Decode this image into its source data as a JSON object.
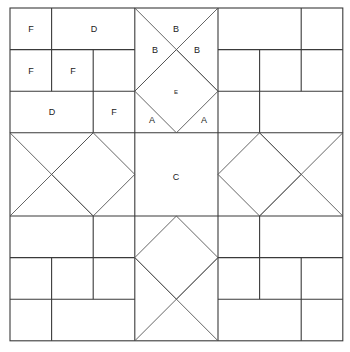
{
  "diagram": {
    "type": "quilt-block-piecing-diagram",
    "grid": "8x8",
    "labels": [
      {
        "id": "tl-f1",
        "text": "F",
        "x": 31,
        "y": 29
      },
      {
        "id": "tl-d1",
        "text": "D",
        "x": 94,
        "y": 29
      },
      {
        "id": "tl-f2",
        "text": "F",
        "x": 31,
        "y": 71
      },
      {
        "id": "tl-f3",
        "text": "F",
        "x": 73,
        "y": 71
      },
      {
        "id": "tl-d2",
        "text": "D",
        "x": 52,
        "y": 112
      },
      {
        "id": "tl-f4",
        "text": "F",
        "x": 114,
        "y": 112
      },
      {
        "id": "tc-b-top",
        "text": "B",
        "x": 176,
        "y": 29
      },
      {
        "id": "tc-b-left",
        "text": "B",
        "x": 155,
        "y": 50
      },
      {
        "id": "tc-b-right",
        "text": "B",
        "x": 197,
        "y": 50
      },
      {
        "id": "tc-e",
        "text": "E",
        "x": 176,
        "y": 92,
        "small": true
      },
      {
        "id": "tc-a-left",
        "text": "A",
        "x": 152,
        "y": 120
      },
      {
        "id": "tc-a-right",
        "text": "A",
        "x": 204,
        "y": 120
      },
      {
        "id": "center-c",
        "text": "C",
        "x": 176,
        "y": 177
      }
    ],
    "colors": {
      "line": "#3a3a3a",
      "background": "#ffffff"
    }
  }
}
